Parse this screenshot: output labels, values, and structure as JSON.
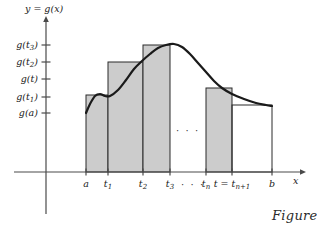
{
  "figure": {
    "caption": "Figure",
    "axis_title_y": "y = g(x)",
    "axis_title_x": "x",
    "inner_ellipsis": "· · ·",
    "axis_ellipsis": "· · ·"
  },
  "colors": {
    "bar_fill": "#cccccc",
    "bar_stroke": "#2a2a2a",
    "curve": "#1a1a1a",
    "axis": "#4a4a4a",
    "text": "#1a1a1a",
    "background": "#ffffff"
  },
  "y_ticks": [
    {
      "label": "g(t",
      "sub": "3",
      "close": ")",
      "full": "g(t3)",
      "y_px": 45,
      "value_name": "g(t_3)"
    },
    {
      "label": "g(t",
      "sub": "2",
      "close": ")",
      "full": "g(t2)",
      "y_px": 62,
      "value_name": "g(t_2)"
    },
    {
      "label": "g(t",
      "sub": "",
      "close": ")",
      "full": "g(t)",
      "y_px": 79,
      "value_name": "g(t)"
    },
    {
      "label": "g(t",
      "sub": "1",
      "close": ")",
      "full": "g(t1)",
      "y_px": 97,
      "value_name": "g(t_1)"
    },
    {
      "label": "g(a",
      "sub": "",
      "close": ")",
      "full": "g(a)",
      "y_px": 113,
      "value_name": "g(a)"
    }
  ],
  "x_ticks": [
    {
      "full": "a",
      "base": "a",
      "sub": "",
      "x_px": 86
    },
    {
      "full": "t1",
      "base": "t",
      "sub": "1",
      "x_px": 108
    },
    {
      "full": "t2",
      "base": "t",
      "sub": "2",
      "x_px": 143
    },
    {
      "full": "t3",
      "base": "t",
      "sub": "3",
      "x_px": 170
    },
    {
      "full": "tn",
      "base": "t",
      "sub": "n",
      "x_px": 206
    },
    {
      "full": "t = tn+1",
      "base": "t = t",
      "sub": "n+1",
      "x_px": 232
    },
    {
      "full": "b",
      "base": "b",
      "sub": "",
      "x_px": 272
    }
  ],
  "chart_data": {
    "type": "bar",
    "title": "",
    "xlabel": "x",
    "ylabel": "y = g(x)",
    "grid": false,
    "legend": false,
    "axis_origin_px": {
      "x": 46,
      "y": 172
    },
    "x_axis_range_px": [
      14,
      300
    ],
    "y_axis_range_px": [
      172,
      22
    ],
    "categories": [
      "[a, t1]",
      "[t1, t2]",
      "[t2, t3]",
      "[tn, t]",
      "[t, b]"
    ],
    "bars": [
      {
        "name": "bar-a-t1",
        "x0_px": 86,
        "x1_px": 108,
        "top_px": 95,
        "height_label": "g(t1)",
        "filled": true
      },
      {
        "name": "bar-t1-t2",
        "x0_px": 108,
        "x1_px": 143,
        "top_px": 62,
        "height_label": "g(t2)",
        "filled": true
      },
      {
        "name": "bar-t2-t3",
        "x0_px": 143,
        "x1_px": 170,
        "top_px": 45,
        "height_label": "g(t3)",
        "filled": true
      },
      {
        "name": "bar-tn-t",
        "x0_px": 206,
        "x1_px": 232,
        "top_px": 88,
        "height_label": "g(tn+1)",
        "filled": true
      },
      {
        "name": "bar-t-b",
        "x0_px": 232,
        "x1_px": 272,
        "top_px": 105,
        "height_label": "g(b)",
        "filled": false
      }
    ],
    "curve": {
      "name": "g(x)",
      "description": "smooth curve rising from g(a), small local bump near t1, climbing to a maximum just past t3, then decreasing monotonically to b",
      "points_px": [
        [
          86,
          113
        ],
        [
          90,
          104
        ],
        [
          95,
          96
        ],
        [
          100,
          94
        ],
        [
          105,
          96
        ],
        [
          110,
          96
        ],
        [
          118,
          90
        ],
        [
          126,
          80
        ],
        [
          134,
          69
        ],
        [
          142,
          61
        ],
        [
          150,
          54
        ],
        [
          158,
          48
        ],
        [
          166,
          45
        ],
        [
          174,
          44
        ],
        [
          182,
          47
        ],
        [
          190,
          54
        ],
        [
          198,
          63
        ],
        [
          206,
          72
        ],
        [
          214,
          81
        ],
        [
          222,
          88
        ],
        [
          232,
          94
        ],
        [
          244,
          99
        ],
        [
          256,
          103
        ],
        [
          266,
          105
        ],
        [
          272,
          106
        ]
      ]
    }
  }
}
